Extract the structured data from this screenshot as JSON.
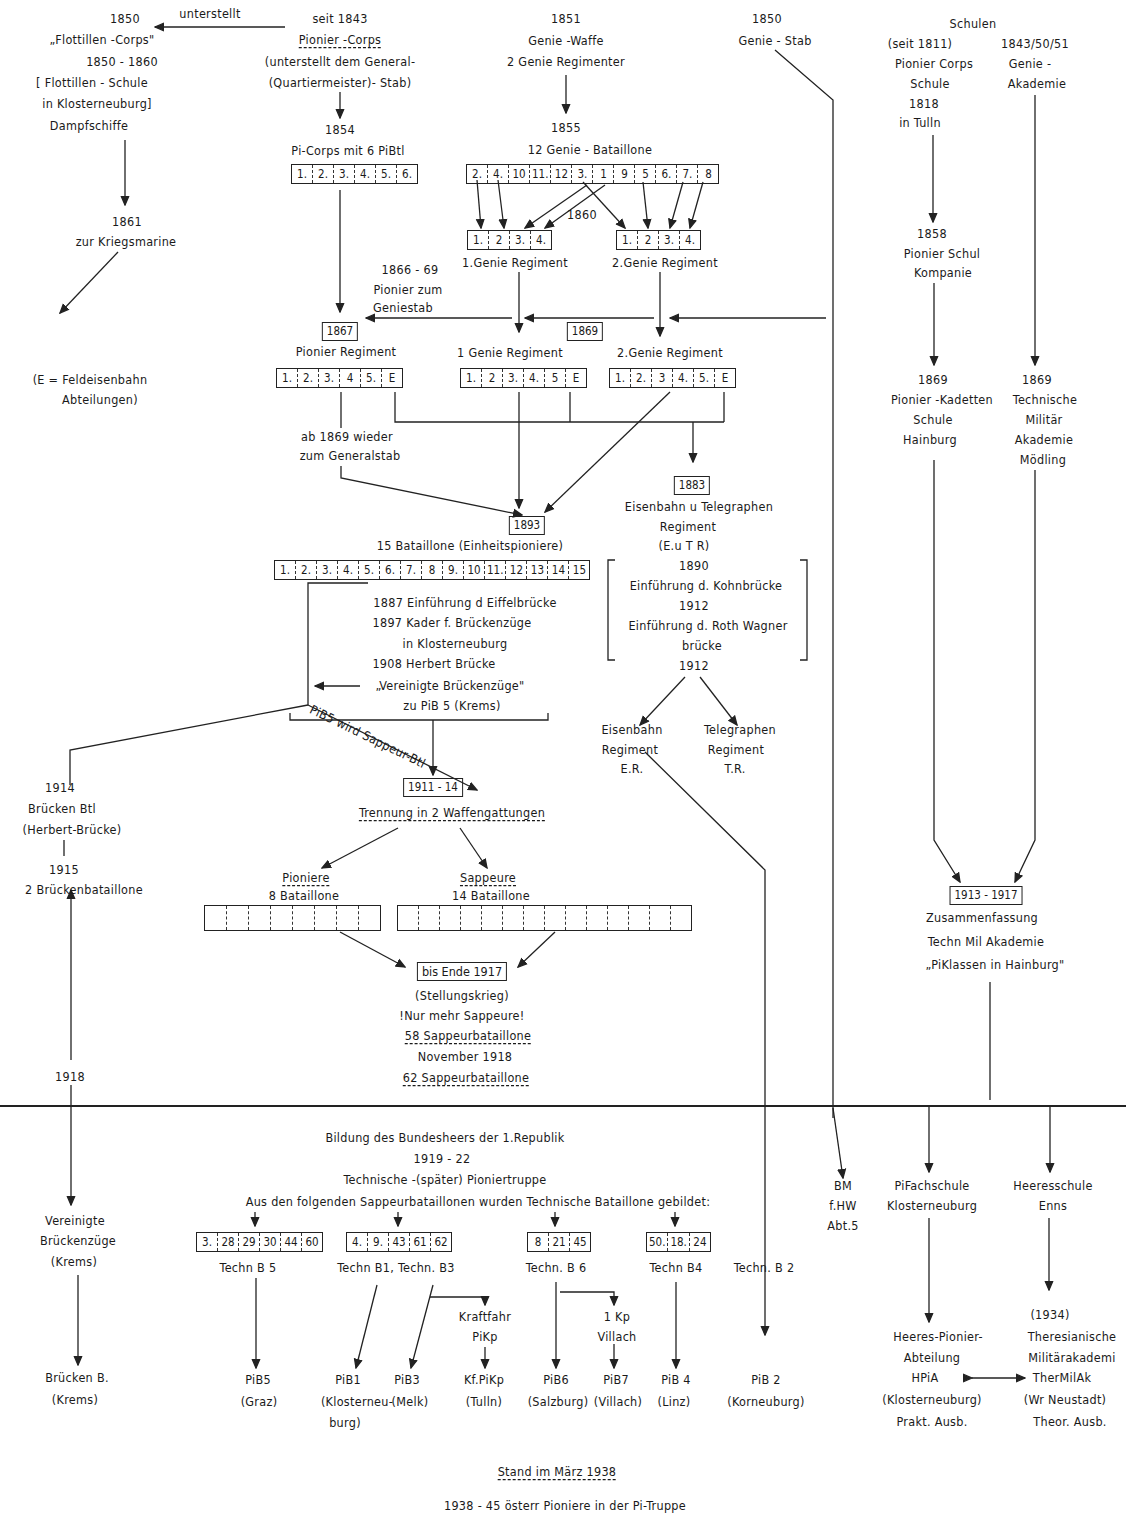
{
  "flottillen": {
    "year": "1850",
    "arrow_label": "unterstellt",
    "name": "„Flottillen -Corps\"",
    "period": "1850 - 1860",
    "school_1": "[ Flottillen - Schule",
    "school_2": "in Klosterneuburg]",
    "ships": "Dampfschiffe",
    "year_1861": "1861",
    "kriegsmarine": "zur Kriegsmarine"
  },
  "legend_e": {
    "line1": "(E = Feldeisenbahn",
    "line2": "Abteilungen)"
  },
  "pionier_corps": {
    "since": "seit 1843",
    "name": "Pionier -Corps",
    "note1": "(unterstellt dem General-",
    "note2": "(Quartiermeister)- Stab)",
    "year_1854": "1854",
    "pibtl": "Pi-Corps mit 6 PiBtl",
    "boxes": [
      "1.",
      "2.",
      "3.",
      "4.",
      "5.",
      "6."
    ]
  },
  "genie_waffe": {
    "year": "1851",
    "name": "Genie -Waffe",
    "regiments": "2 Genie Regimenter",
    "year_1855": "1855",
    "battalions": "12 Genie - Bataillone",
    "boxes": [
      "2.",
      "4.",
      "10",
      "11.",
      "12",
      "3.",
      "1",
      "9",
      "5",
      "6.",
      "7.",
      "8"
    ],
    "year_1860": "1860",
    "reg1_boxes": [
      "1.",
      "2",
      "3.",
      "4."
    ],
    "reg1_label": "1.Genie Regiment",
    "reg2_boxes": [
      "1.",
      "2",
      "3.",
      "4."
    ],
    "reg2_label": "2.Genie Regiment"
  },
  "genie_stab": {
    "year": "1850",
    "name": "Genie - Stab"
  },
  "period_1866": {
    "years": "1866 - 69",
    "line1": "Pionier zum",
    "line2": "Geniestab",
    "year_1867": "1867",
    "year_1869": "1869",
    "pionier_regiment": "Pionier Regiment",
    "pionier_boxes": [
      "1.",
      "2.",
      "3.",
      "4",
      "5.",
      "E"
    ],
    "genie1_label": "1 Genie Regiment",
    "genie1_boxes": [
      "1.",
      "2",
      "3.",
      "4.",
      "5",
      "E"
    ],
    "genie2_label": "2.Genie Regiment",
    "genie2_boxes": [
      "1.",
      "2.",
      "3",
      "4.",
      "5.",
      "E"
    ],
    "return_1": "ab 1869 wieder",
    "return_2": "zum Generalstab"
  },
  "schulen": {
    "title": "Schulen",
    "left_since": "(seit 1811)",
    "left_name": "Pionier Corps",
    "left_school": "Schule",
    "left_year": "1818",
    "left_place": "in Tulln",
    "right_years": "1843/50/51",
    "right_name": "Genie -",
    "right_akad": "Akademie",
    "y1858": "1858",
    "schul_kp1": "Pionier Schul",
    "schul_kp2": "Kompanie",
    "y1869a": "1869",
    "kadetten1": "Pionier -Kadetten",
    "kadetten2": "Schule",
    "kadetten3": "Hainburg",
    "y1869b": "1869",
    "tma1": "Technische",
    "tma2": "Militär",
    "tma3": "Akademie",
    "tma4": "Mödling",
    "y1913": "1913 - 1917",
    "zus1": "Zusammenfassung",
    "zus2": "Techn Mil Akademie",
    "zus3": "„PiKlassen in Hainburg\""
  },
  "eisenbahn": {
    "year": "1883",
    "name1": "Eisenbahn u Telegraphen",
    "name2": "Regiment",
    "abbr": "(E.u T R)",
    "y1890": "1890",
    "kohn": "Einführung d. Kohnbrücke",
    "y1912a": "1912",
    "roth1": "Einführung d. Roth Wagner",
    "roth2": "brücke",
    "y1912b": "1912",
    "eb1": "Eisenbahn",
    "eb2": "Regiment",
    "eb3": "E.R.",
    "tel1": "Telegraphen",
    "tel2": "Regiment",
    "tel3": "T.R."
  },
  "einheit": {
    "year": "1893",
    "label": "15 Bataillone   (Einheitspioniere)",
    "boxes": [
      "1.",
      "2.",
      "3.",
      "4.",
      "5.",
      "6.",
      "7.",
      "8",
      "9.",
      "10",
      "11.",
      "12",
      "13",
      "14",
      "15"
    ],
    "n1": "1887 Einführung d Eiffelbrücke",
    "n2": "1897 Kader f. Brückenzüge",
    "n3": "in Klosterneuburg",
    "n4": "1908 Herbert Brücke",
    "n5": "„Vereinigte Brückenzüge\"",
    "n6": "zu PiB 5 (Krems)",
    "diag": "PiB5 wird Sappeur-Btl"
  },
  "bruecken": {
    "y1914": "1914",
    "btl": "Brücken Btl",
    "herbert": "(Herbert-Brücke)",
    "y1915": "1915",
    "zwei": "2 Brückenbataillone",
    "y1918": "1918"
  },
  "trennung": {
    "years": "1911 - 14",
    "label": "Trennung in 2 Waffengattungen",
    "pion_title": "Pioniere",
    "pion_count": "8 Bataillone",
    "pion_boxes": 8,
    "sapp_title": "Sappeure",
    "sapp_count": "14 Bataillone",
    "sapp_boxes": 14,
    "ende": "bis Ende 1917",
    "stellung": "(Stellungskrieg)",
    "nur": "!Nur mehr Sappeure!",
    "s58": "58 Sappeurbataillone",
    "nov": "November 1918",
    "s62": "62 Sappeurbataillone"
  },
  "republik": {
    "title": "Bildung des Bundesheers der 1.Republik",
    "years": "1919 - 22",
    "sub": "Technische -(später) Pioniertruppe",
    "intro": "Aus den folgenden Sappeurbataillonen wurden Technische Bataillone gebildet:",
    "vb1": "Vereinigte",
    "vb2": "Brückenzüge",
    "vb3": "(Krems)",
    "bb1": "Brücken B.",
    "bb2": "(Krems)",
    "g5_boxes": [
      "3.",
      "28",
      "29",
      "30",
      "44",
      "60"
    ],
    "g5_label": "Techn B 5",
    "g13_boxes": [
      "4.",
      "9.",
      "43",
      "61",
      "62"
    ],
    "g13_label": "Techn B1, Techn. B3",
    "g6_boxes": [
      "8",
      "21",
      "45"
    ],
    "g6_label": "Techn. B 6",
    "g4_boxes": [
      "50.",
      "18.",
      "24"
    ],
    "g4_label": "Techn B4",
    "g2_label": "Techn. B 2",
    "kf1": "Kraftfahr",
    "kf2": "PiKp",
    "kp1": "1 Kp",
    "kp2": "Villach",
    "bm1": "BM",
    "bm2": "f.HW",
    "bm3": "Abt.5",
    "pifach1": "PiFachschule",
    "pifach2": "Klosterneuburg",
    "heer1": "Heeresschule",
    "heer2": "Enns",
    "r_pib5": "PiB5",
    "r_pib5p": "(Graz)",
    "r_pib1": "PiB1",
    "r_pib1p1": "(Klosterneu-",
    "r_pib1p2": "burg)",
    "r_pib3": "PiB3",
    "r_pib3p": "(Melk)",
    "r_kf": "Kf.PiKp",
    "r_kfp": "(Tulln)",
    "r_pib6": "PiB6",
    "r_pib6p": "(Salzburg)",
    "r_pib7": "PiB7",
    "r_pib7p": "(Villach)",
    "r_pib4": "PiB 4",
    "r_pib4p": "(Linz)",
    "r_pib2": "PiB 2",
    "r_pib2p": "(Korneuburg)",
    "y1934": "(1934)",
    "ther1": "Theresianische",
    "ther2": "Militärakademi",
    "ther3": "TherMilAk",
    "ther4": "(Wr Neustadt)",
    "ther5": "Theor. Ausb.",
    "hpia1": "Heeres-Pionier-",
    "hpia2": "Abteilung",
    "hpia3": "HPiA",
    "hpia4": "(Klosterneuburg)",
    "hpia5": "Prakt. Ausb."
  },
  "footer": {
    "stand": "Stand im März 1938",
    "final": "1938 - 45 österr Pioniere in der Pi-Truppe"
  }
}
